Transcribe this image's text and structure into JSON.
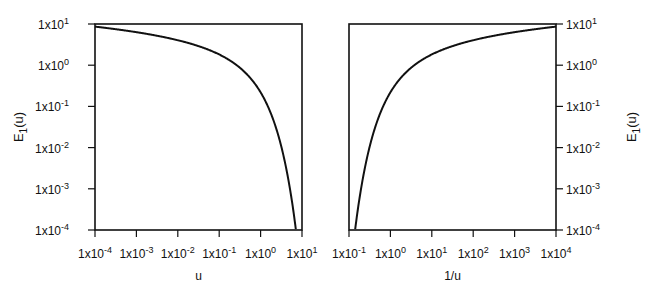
{
  "chart_data": [
    {
      "type": "line",
      "title": "",
      "xlabel": "u",
      "ylabel": "E1(u)",
      "xscale": "log",
      "yscale": "log",
      "xlim": [
        0.0001,
        10
      ],
      "ylim": [
        0.0001,
        10
      ],
      "x_ticks": [
        "1x10^-4",
        "1x10^-3",
        "1x10^-2",
        "1x10^-1",
        "1x10^0",
        "1x10^1"
      ],
      "y_ticks": [
        "1x10^-4",
        "1x10^-3",
        "1x10^-2",
        "1x10^-1",
        "1x10^0",
        "1x10^1"
      ],
      "y_axis_side": "left",
      "grid": false,
      "series": [
        {
          "name": "E1(u)",
          "x": [
            0.0001,
            0.001,
            0.01,
            0.1,
            0.5,
            1,
            2,
            3,
            5,
            7.5
          ],
          "y": [
            8.63,
            6.33,
            4.04,
            1.82,
            0.56,
            0.219,
            0.0489,
            0.013,
            0.00115,
            0.0001
          ]
        }
      ]
    },
    {
      "type": "line",
      "title": "",
      "xlabel": "1/u",
      "ylabel": "E1(u)",
      "xscale": "log",
      "yscale": "log",
      "xlim": [
        0.1,
        10000
      ],
      "ylim": [
        0.0001,
        10
      ],
      "x_ticks": [
        "1x10^-1",
        "1x10^0",
        "1x10^1",
        "1x10^2",
        "1x10^3",
        "1x10^4"
      ],
      "y_ticks": [
        "1x10^-4",
        "1x10^-3",
        "1x10^-2",
        "1x10^-1",
        "1x10^0",
        "1x10^1"
      ],
      "y_axis_side": "right",
      "grid": false,
      "series": [
        {
          "name": "E1(u)",
          "x": [
            0.133,
            0.2,
            0.333,
            0.5,
            1,
            2,
            10,
            100,
            1000,
            10000
          ],
          "y": [
            0.0001,
            0.00115,
            0.013,
            0.0489,
            0.219,
            0.56,
            1.82,
            4.04,
            6.33,
            8.63
          ]
        }
      ]
    }
  ],
  "labels": {
    "left_xlabel": "u",
    "right_xlabel": "1/u",
    "ylabel_main": "E",
    "ylabel_sub": "1",
    "ylabel_rest": "(u)",
    "tick_base": "1x10",
    "left_x_exps": [
      "-4",
      "-3",
      "-2",
      "-1",
      "0",
      "1"
    ],
    "right_x_exps": [
      "-1",
      "0",
      "1",
      "2",
      "3",
      "4"
    ],
    "y_exps": [
      "1",
      "0",
      "-1",
      "-2",
      "-3",
      "-4"
    ]
  }
}
